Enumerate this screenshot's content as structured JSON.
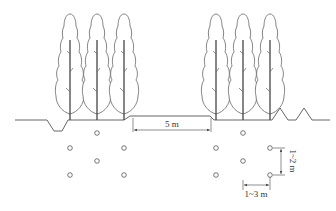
{
  "diagram": {
    "type": "planting-layout-cross-section",
    "colors": {
      "line": "#555555",
      "tree": "#666666",
      "trunk": "#444444",
      "text": "#333333"
    },
    "tree_groups": [
      {
        "name": "left",
        "trunks_x": [
          70,
          97,
          124
        ]
      },
      {
        "name": "right",
        "trunks_x": [
          216,
          243,
          270
        ]
      }
    ],
    "pits": [
      {
        "group": "left",
        "x": 97,
        "y": 133
      },
      {
        "group": "left",
        "x": 70,
        "y": 148
      },
      {
        "group": "left",
        "x": 124,
        "y": 148
      },
      {
        "group": "left",
        "x": 97,
        "y": 161
      },
      {
        "group": "left",
        "x": 70,
        "y": 175
      },
      {
        "group": "left",
        "x": 124,
        "y": 175
      },
      {
        "group": "right",
        "x": 243,
        "y": 133
      },
      {
        "group": "right",
        "x": 216,
        "y": 148
      },
      {
        "group": "right",
        "x": 270,
        "y": 148
      },
      {
        "group": "right",
        "x": 243,
        "y": 161
      },
      {
        "group": "right",
        "x": 216,
        "y": 175
      },
      {
        "group": "right",
        "x": 270,
        "y": 175
      }
    ],
    "dimensions": {
      "road_width": "5 m",
      "row_spacing": "1~2 m",
      "plant_spacing": "1~3 m"
    }
  }
}
